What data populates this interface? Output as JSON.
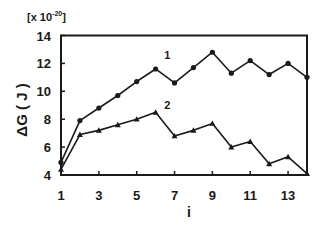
{
  "chart_data": {
    "type": "line",
    "title": "",
    "multiplier_label": "[x 10",
    "multiplier_exponent": "-20",
    "multiplier_close": "]",
    "xlabel": "i",
    "ylabel": "ΔG ( J )",
    "xlim": [
      1,
      14
    ],
    "ylim": [
      4,
      14
    ],
    "x_ticks": [
      1,
      3,
      5,
      7,
      9,
      11,
      13
    ],
    "x_minor_ticks": [
      1,
      2,
      3,
      4,
      5,
      6,
      7,
      8,
      9,
      10,
      11,
      12,
      13,
      14
    ],
    "y_ticks": [
      4,
      6,
      8,
      10,
      12,
      14
    ],
    "grid": false,
    "legend": "inline labels",
    "x": [
      1,
      2,
      3,
      4,
      5,
      6,
      7,
      8,
      9,
      10,
      11,
      12,
      13,
      14
    ],
    "series": [
      {
        "name": "1",
        "marker": "circle",
        "values": [
          4.9,
          7.9,
          8.8,
          9.7,
          10.7,
          11.6,
          10.6,
          11.7,
          12.8,
          11.3,
          12.2,
          11.2,
          12.0,
          11.0
        ],
        "label_pos": {
          "i": 6.45,
          "y": 12.3
        }
      },
      {
        "name": "2",
        "marker": "triangle",
        "values": [
          4.4,
          6.9,
          7.2,
          7.6,
          8.0,
          8.5,
          6.8,
          7.2,
          7.7,
          6.0,
          6.4,
          4.8,
          5.3,
          4.1
        ],
        "label_pos": {
          "i": 6.45,
          "y": 8.7
        }
      }
    ],
    "colors": {
      "line": "#1a1a1a",
      "axis": "#1a1a1a",
      "background": "#ffffff"
    }
  }
}
